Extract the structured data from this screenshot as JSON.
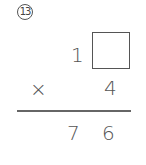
{
  "problem": {
    "number": "13",
    "multiplicand_tens": "1",
    "multiplicand_ones_blank": "",
    "operator": "×",
    "multiplier": "4",
    "product_tens": "7",
    "product_ones": "6"
  }
}
